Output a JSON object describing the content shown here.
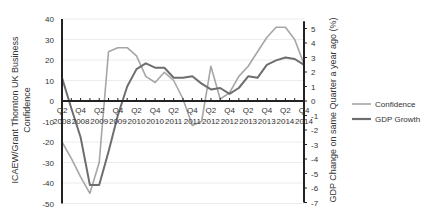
{
  "chart_data": {
    "type": "line",
    "title": "",
    "ylabel_left": "ICAEW/Grant Thornton UK Business Confidence",
    "ylabel_right": "GDP Change on same Quarter a year ago (%)",
    "ylim_left": [
      -50,
      40
    ],
    "ylim_right": [
      -7,
      5.5
    ],
    "yticks_left": [
      40,
      30,
      20,
      10,
      0,
      -10,
      -20,
      -30,
      -40,
      -50
    ],
    "yticks_right": [
      5,
      4,
      3,
      2,
      1,
      0,
      -1,
      -2,
      -3,
      -4,
      -5,
      -6,
      -7
    ],
    "xtick_labels": [
      "Q2 2008",
      "Q4 2008",
      "Q2 2009",
      "Q4 2009",
      "Q2 2010",
      "Q4 2010",
      "Q2 2011",
      "Q4 2011",
      "Q2 2012",
      "Q4 2012",
      "Q2 2013",
      "Q4 2013",
      "Q2 2014",
      "Q4 2014"
    ],
    "x": [
      "Q2 2008",
      "Q3 2008",
      "Q4 2008",
      "Q1 2009",
      "Q2 2009",
      "Q3 2009",
      "Q4 2009",
      "Q1 2010",
      "Q2 2010",
      "Q3 2010",
      "Q4 2010",
      "Q1 2011",
      "Q2 2011",
      "Q3 2011",
      "Q4 2011",
      "Q1 2012",
      "Q2 2012",
      "Q3 2012",
      "Q4 2012",
      "Q1 2013",
      "Q2 2013",
      "Q3 2013",
      "Q4 2013",
      "Q1 2014",
      "Q2 2014",
      "Q3 2014",
      "Q4 2014"
    ],
    "series": [
      {
        "name": "Confidence",
        "axis": "left",
        "color": "#a6a6a6",
        "values": [
          -20,
          -28,
          -37,
          -45,
          -30,
          24,
          26,
          26,
          22,
          12,
          9,
          14,
          10,
          1,
          -12,
          -10,
          17,
          1,
          4,
          12,
          17,
          24,
          31,
          36,
          36,
          30,
          18
        ]
      },
      {
        "name": "GDP Growth",
        "axis": "right",
        "color": "#6e6e6e",
        "values": [
          1.6,
          -0.5,
          -2.5,
          -5.8,
          -5.8,
          -3.5,
          -1.0,
          1.0,
          2.2,
          2.6,
          2.3,
          2.3,
          1.6,
          1.6,
          1.7,
          1.2,
          0.8,
          0.9,
          0.5,
          0.9,
          1.7,
          1.6,
          2.5,
          2.8,
          3.0,
          2.9,
          2.5
        ]
      }
    ],
    "legend": {
      "position": "right",
      "entries": [
        "Confidence",
        "GDP Growth"
      ]
    },
    "grid": true
  }
}
